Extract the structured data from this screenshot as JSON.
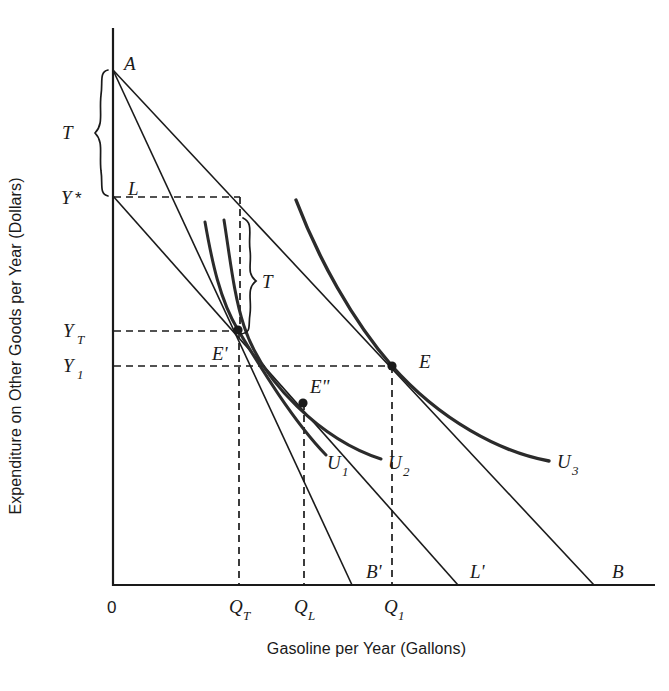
{
  "axes": {
    "y_title": "Expenditure on Other Goods per Year (Dollars)",
    "x_title": "Gasoline per Year (Gallons)",
    "origin_label": "0"
  },
  "y_ticks": [
    {
      "key": "Y_star",
      "base": "Y",
      "sub": "*",
      "y": 197
    },
    {
      "key": "Y_T",
      "base": "Y",
      "sub": "T",
      "y": 331
    },
    {
      "key": "Y_1",
      "base": "Y",
      "sub": "1",
      "y": 366
    }
  ],
  "x_ticks": [
    {
      "key": "Q_T",
      "base": "Q",
      "sub": "T",
      "x": 240
    },
    {
      "key": "Q_L",
      "base": "Q",
      "sub": "L",
      "x": 305
    },
    {
      "key": "Q_1",
      "base": "Q",
      "sub": "1",
      "x": 395
    }
  ],
  "points": [
    {
      "key": "A",
      "label": "A",
      "x": 113,
      "y": 70,
      "dot": false
    },
    {
      "key": "L",
      "label": "L",
      "x": 113,
      "y": 196,
      "dot": false
    },
    {
      "key": "E_prime",
      "label": "E'",
      "x": 238,
      "y": 330,
      "dot": true
    },
    {
      "key": "E_double_prime",
      "label": "E\"",
      "x": 303,
      "y": 403,
      "dot": true
    },
    {
      "key": "E",
      "label": "E",
      "x": 392,
      "y": 366,
      "dot": true
    }
  ],
  "budget_lines": [
    {
      "key": "AB",
      "end_label": "B",
      "end_x": 594,
      "label_x": 617,
      "label_y": 578
    },
    {
      "key": "AB_prime",
      "end_label": "B'",
      "end_x": 352,
      "label_x": 368,
      "label_y": 578
    },
    {
      "key": "LL_prime",
      "end_label": "L'",
      "end_x": 458,
      "label_x": 474,
      "label_y": 578
    }
  ],
  "indifference_curves": [
    {
      "key": "U1",
      "base": "U",
      "sub": "1",
      "label_x": 335,
      "label_y": 466
    },
    {
      "key": "U2",
      "base": "U",
      "sub": "2",
      "label_x": 396,
      "label_y": 466
    },
    {
      "key": "U3",
      "base": "U",
      "sub": "3",
      "label_x": 565,
      "label_y": 465
    }
  ],
  "braces": [
    {
      "key": "tax-brace-vertical",
      "label": "T",
      "label_x": 70,
      "label_y": 137,
      "span_top": 70,
      "span_bottom": 196
    },
    {
      "key": "tax-brace-interior",
      "label": "T",
      "label_x": 266,
      "label_y": 281,
      "span_top": 218,
      "span_bottom": 330
    }
  ],
  "colors": {
    "ink": "#1a1a1a",
    "curve": "#2b2b2b",
    "background": "#ffffff"
  }
}
